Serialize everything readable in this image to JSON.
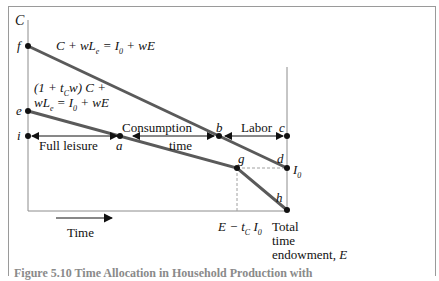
{
  "figure": {
    "axis_label_y": "C",
    "points": {
      "f": "f",
      "e": "e",
      "i": "i",
      "a": "a",
      "b": "b",
      "c": "c",
      "d": "d",
      "g": "g",
      "h": "h"
    },
    "equation_upper": "C + wL",
    "equation_upper_sub": "e",
    "equation_upper_rhs": " = I",
    "equation_upper_rhs_sub": "0",
    "equation_upper_tail": "+ wE",
    "equation_lower_line1": "(1 + t",
    "equation_lower_line1_sub": "C",
    "equation_lower_line1_tail": "w) C +",
    "equation_lower_line2": "wL",
    "equation_lower_line2_sub": "e",
    "equation_lower_line2_rhs": " = I",
    "equation_lower_line2_rhs_sub": "0",
    "equation_lower_line2_tail": "+ wE",
    "segment_full_leisure": "Full leisure",
    "segment_consumption_1": "Consumption",
    "segment_consumption_2": "time",
    "segment_labor": "Labor",
    "income_label": "I",
    "income_label_sub": "0",
    "x_marker": "E − t",
    "x_marker_sub": "C",
    "x_marker_tail": "I",
    "x_marker_tail_sub": "0",
    "time_arrow_label": "Time",
    "endowment_line1": "Total",
    "endowment_line2": "time",
    "endowment_line3": "endowment, ",
    "endowment_var": "E"
  },
  "caption": "Figure 5.10   Time Allocation in Household Production with"
}
